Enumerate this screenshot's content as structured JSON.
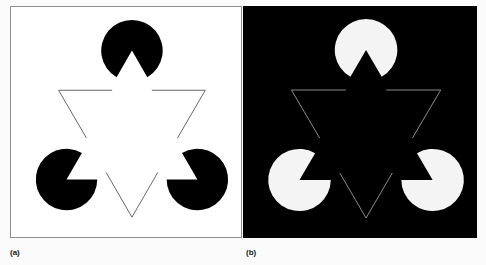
{
  "figure": {
    "background_color": "#fbfbfb"
  },
  "panels": [
    {
      "id": "a",
      "caption": "(a)",
      "background_color": "#ffffff",
      "inducer_color": "#000000",
      "outline_color": "#555555",
      "border_color": "#8e8e8e",
      "description": "Three black pac-man inducers with a thin dark outlined inverted triangle on a white ground"
    },
    {
      "id": "b",
      "caption": "(b)",
      "background_color": "#000000",
      "inducer_color": "#f4f4f4",
      "outline_color": "#9a9a9a",
      "border_color": "#000000",
      "description": "Three white pac-man inducers with a thin light outlined inverted triangle on a black ground"
    }
  ],
  "geometry": {
    "viewbox": "0 0 232 232",
    "inducers": [
      {
        "name": "top-inducer",
        "cx": 122,
        "cy": 44,
        "r": 31,
        "notch_start_deg": 60,
        "notch_end_deg": 120
      },
      {
        "name": "bottom-left-inducer",
        "cx": 56,
        "cy": 174,
        "r": 31,
        "notch_start_deg": -60,
        "notch_end_deg": 0
      },
      {
        "name": "bottom-right-inducer",
        "cx": 188,
        "cy": 174,
        "r": 31,
        "notch_start_deg": 180,
        "notch_end_deg": 240
      }
    ],
    "outline_triangle": {
      "name": "illusory-triangle-outline",
      "vertices": [
        [
          48,
          84
        ],
        [
          196,
          84
        ],
        [
          122,
          212
        ]
      ],
      "gap_fraction": 0.27,
      "stroke_width": 0.9
    }
  }
}
